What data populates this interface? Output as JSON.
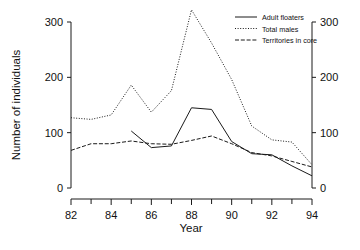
{
  "chart_data": {
    "type": "line",
    "title": "",
    "xlabel": "Year",
    "ylabel": "Number of individuals",
    "xlim": [
      82,
      94
    ],
    "ylim": [
      0,
      300
    ],
    "xticks": [
      82,
      84,
      86,
      88,
      90,
      92,
      94
    ],
    "xtick_labels": [
      "82",
      "84",
      "86",
      "88",
      "90",
      "92",
      "94"
    ],
    "x_minor_ticks": [
      83,
      85,
      87,
      89,
      91,
      93
    ],
    "yticks": [
      0,
      100,
      200,
      300
    ],
    "ytick_labels": [
      "0",
      "100",
      "200",
      "300"
    ],
    "right_axis": true,
    "right_ytick_labels": [
      "0",
      "100",
      "200",
      "300"
    ],
    "grid": false,
    "legend_position": "top-right",
    "x": [
      82,
      83,
      84,
      85,
      86,
      87,
      88,
      89,
      90,
      91,
      92,
      93,
      94
    ],
    "series": [
      {
        "name": "Adult floaters",
        "style": "solid",
        "x": [
          85,
          86,
          87,
          88,
          89,
          90,
          91,
          92,
          93,
          94
        ],
        "values": [
          103,
          73,
          76,
          145,
          142,
          84,
          62,
          60,
          40,
          22
        ]
      },
      {
        "name": "Total males",
        "style": "dotted",
        "x": [
          82,
          83,
          84,
          85,
          86,
          87,
          88,
          89,
          90,
          91,
          92,
          93,
          94
        ],
        "values": [
          127,
          124,
          132,
          186,
          137,
          176,
          322,
          262,
          196,
          112,
          87,
          83,
          42
        ]
      },
      {
        "name": "Territories in core",
        "style": "dashdot",
        "x": [
          82,
          83,
          84,
          85,
          86,
          87,
          88,
          89,
          90,
          91,
          92,
          93,
          94
        ],
        "values": [
          68,
          80,
          80,
          85,
          80,
          79,
          86,
          94,
          80,
          64,
          58,
          48,
          38
        ]
      }
    ]
  },
  "axes": {
    "y_axis_title": "Number of individuals",
    "x_axis_title": "Year"
  },
  "legend": {
    "items": [
      {
        "label": "Adult floaters",
        "style": "solid"
      },
      {
        "label": "Total males",
        "style": "dotted"
      },
      {
        "label": "Territories in core",
        "style": "dashdot"
      }
    ]
  }
}
